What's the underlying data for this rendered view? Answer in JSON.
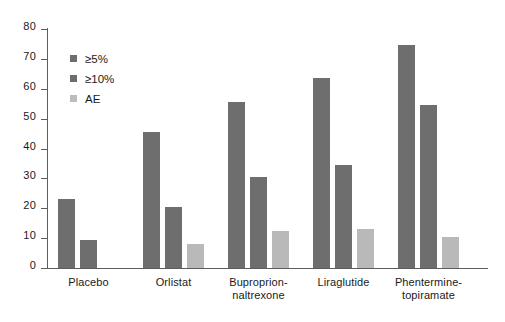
{
  "chart_data": {
    "type": "bar",
    "title": "",
    "subtitle": "",
    "xlabel": "",
    "ylabel": "",
    "ylim": [
      0,
      80
    ],
    "yticks": [
      0,
      10,
      20,
      30,
      40,
      50,
      60,
      70,
      80
    ],
    "grid": false,
    "legend_position": "upper-left-inside",
    "categories": [
      "Placebo",
      "Orlistat",
      "Buproprion-\nnaltrexone",
      "Liraglutide",
      "Phentermine-\ntopiramate"
    ],
    "category_lines": [
      [
        "Placebo"
      ],
      [
        "Orlistat"
      ],
      [
        "Buproprion-",
        "naltrexone"
      ],
      [
        "Liraglutide"
      ],
      [
        "Phentermine-",
        "topiramate"
      ]
    ],
    "series": [
      {
        "name": "≥5%",
        "color": "#6e6e6e",
        "values": [
          23,
          45.5,
          55.5,
          63.5,
          74.5
        ]
      },
      {
        "name": "≥10%",
        "color": "#6e6e6e",
        "values": [
          9.3,
          20.3,
          30.5,
          34.5,
          54.5
        ]
      },
      {
        "name": "AE",
        "color": "#b9b9b9",
        "values": [
          null,
          8,
          12.5,
          13,
          10.5
        ]
      }
    ]
  },
  "legend": {
    "items": [
      {
        "label": "≥5%",
        "color": "#6e6e6e"
      },
      {
        "label": "≥10%",
        "color": "#6e6e6e"
      },
      {
        "label": "AE",
        "color": "#bcbcbc"
      }
    ]
  },
  "axis": {
    "y_tick_labels": [
      "0",
      "10",
      "20",
      "30",
      "40",
      "50",
      "60",
      "70",
      "80"
    ],
    "axis_color": "#5d5d5d"
  }
}
